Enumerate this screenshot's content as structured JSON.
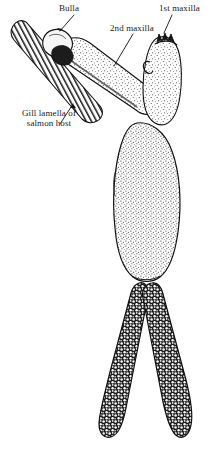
{
  "figure": {
    "background_color": "#ffffff",
    "ink_color": "#111111",
    "width": 213,
    "height": 457
  },
  "labels": {
    "bulla": "Bulla",
    "second_maxilla": "2nd maxilla",
    "first_maxilla": "1st maxilla",
    "gill_lamella": "Gill lamella of salmon host"
  },
  "structures": [
    {
      "name": "gill-lamella",
      "description": "Elongated diagonal gill lamella of the salmon host, filled with parallel hatched filaments",
      "fill": "hatched-parallel-lines"
    },
    {
      "name": "bulla",
      "description": "Dark anchoring knob embedded in the gill lamella at the tip of the second maxilla",
      "fill": "dark-solid"
    },
    {
      "name": "second-maxilla",
      "description": "Long tubular stippled arm running from the bulla down-right to the cephalothorax",
      "fill": "stippled"
    },
    {
      "name": "first-maxilla",
      "description": "Dark serrated mouth appendages at the anterior tip of the head",
      "fill": "dark-serrated"
    },
    {
      "name": "cephalothorax",
      "description": "Stippled head region bearing the first maxilla and a small hooked appendage",
      "fill": "stippled"
    },
    {
      "name": "trunk",
      "description": "Large ovoid stippled trunk forming the main body of the parasite",
      "fill": "stippled"
    },
    {
      "name": "egg-string-left",
      "description": "Dark left egg string with granular cellular texture and rounded tip",
      "fill": "dark-cellular"
    },
    {
      "name": "egg-string-right",
      "description": "Dark right egg string with granular cellular texture and rounded tip",
      "fill": "dark-cellular"
    }
  ]
}
